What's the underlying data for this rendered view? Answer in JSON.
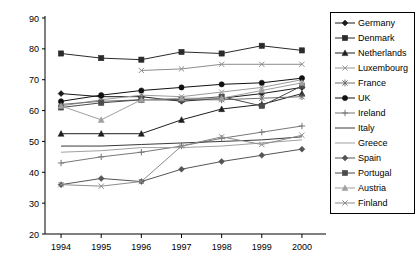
{
  "chart_data": {
    "type": "line",
    "title": "",
    "subtitle": "",
    "xlabel": "",
    "ylabel": "",
    "grid": false,
    "legend_position": "right",
    "x": [
      1994,
      1995,
      1996,
      1997,
      1998,
      1999,
      2000
    ],
    "xtick_labels": [
      "1994",
      "1995",
      "1996",
      "1997",
      "1998",
      "1999",
      "2000"
    ],
    "ytick_labels": [
      "20",
      "30",
      "40",
      "50",
      "60",
      "70",
      "80",
      "90"
    ],
    "yticks": [
      20,
      30,
      40,
      50,
      60,
      70,
      80,
      90
    ],
    "ylim": [
      20,
      90
    ],
    "xlim": [
      1993.6,
      2000.4
    ],
    "series": [
      {
        "name": "Germany",
        "marker": "diamond",
        "color": "#1a1a1a",
        "values": [
          65.5,
          64.5,
          64.5,
          63.0,
          64.0,
          65.5,
          67.5
        ]
      },
      {
        "name": "Denmark",
        "marker": "square",
        "color": "#2b2b2b",
        "values": [
          78.5,
          77.0,
          76.5,
          79.0,
          78.5,
          81.0,
          79.5
        ]
      },
      {
        "name": "Netherlands",
        "marker": "triangle",
        "color": "#1f1f1f",
        "values": [
          52.5,
          52.5,
          52.5,
          57.0,
          60.5,
          62.0,
          65.5
        ]
      },
      {
        "name": "Luxembourg",
        "marker": "x",
        "color": "#9a9a9a",
        "values": [
          61.5,
          63.5,
          65.0,
          64.5,
          66.0,
          67.5,
          70.0
        ]
      },
      {
        "name": "France",
        "marker": "star",
        "color": "#6e6e6e",
        "values": [
          62.0,
          63.0,
          63.5,
          63.5,
          63.5,
          64.0,
          64.5
        ]
      },
      {
        "name": "UK",
        "marker": "circle",
        "color": "#111111",
        "values": [
          63.0,
          65.0,
          66.5,
          67.5,
          68.5,
          69.0,
          70.5
        ]
      },
      {
        "name": "Ireland",
        "marker": "plus",
        "color": "#777777",
        "values": [
          43.0,
          45.0,
          46.5,
          48.5,
          51.0,
          53.0,
          55.0
        ]
      },
      {
        "name": "Italy",
        "marker": "none",
        "color": "#3a3a3a",
        "values": [
          48.5,
          48.5,
          49.0,
          49.5,
          50.0,
          50.5,
          51.5
        ]
      },
      {
        "name": "Greece",
        "marker": "none",
        "color": "#a0a0a0",
        "values": [
          46.5,
          47.0,
          48.0,
          48.0,
          48.5,
          49.5,
          50.5
        ]
      },
      {
        "name": "Spain",
        "marker": "diamond",
        "color": "#555555",
        "values": [
          36.0,
          38.0,
          37.0,
          41.0,
          43.5,
          45.5,
          47.5
        ]
      },
      {
        "name": "Portugal",
        "marker": "square",
        "color": "#4b4b4b",
        "values": [
          61.0,
          62.5,
          63.5,
          63.5,
          64.5,
          61.5,
          68.0
        ]
      },
      {
        "name": "Austria",
        "marker": "triangle",
        "color": "#9f9f9f",
        "values": [
          61.5,
          57.0,
          63.5,
          64.0,
          64.0,
          66.5,
          69.0
        ]
      },
      {
        "name": "Finland",
        "marker": "x",
        "color": "#8c8c8c",
        "values": [
          36.0,
          35.5,
          37.0,
          48.5,
          51.5,
          49.0,
          52.0
        ]
      }
    ],
    "finland_upper": {
      "name": "Finland",
      "marker": "x",
      "color": "#8c8c8c",
      "x": [
        1996,
        1997,
        1998,
        1999,
        2000
      ],
      "values": [
        73.0,
        73.5,
        75.0,
        75.0,
        75.0
      ]
    }
  },
  "legend": {
    "items": [
      {
        "label": "Germany"
      },
      {
        "label": "Denmark"
      },
      {
        "label": "Netherlands"
      },
      {
        "label": "Luxembourg"
      },
      {
        "label": "France"
      },
      {
        "label": "UK"
      },
      {
        "label": "Ireland"
      },
      {
        "label": "Italy"
      },
      {
        "label": "Greece"
      },
      {
        "label": "Spain"
      },
      {
        "label": "Portugal"
      },
      {
        "label": "Austria"
      },
      {
        "label": "Finland"
      }
    ]
  }
}
